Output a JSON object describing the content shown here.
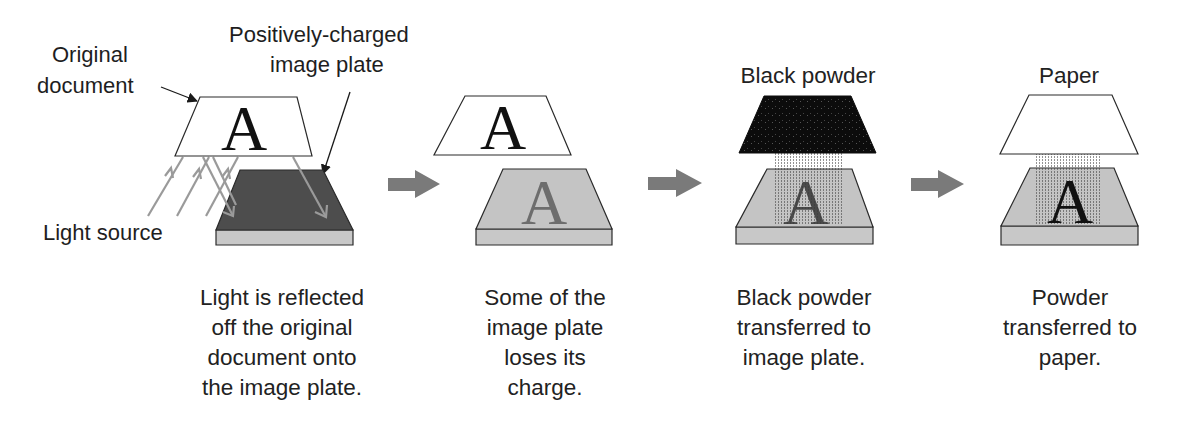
{
  "diagram": {
    "type": "process-flow",
    "colors": {
      "outline": "#2a2a2a",
      "plate_charged": "#4d4d4d",
      "plate_discharged": "#c4c4c4",
      "plate_side": "#c8c8c8",
      "flow_arrow": "#7a7a7a",
      "light_ray": "#9a9a9a",
      "black_powder": "#0c0c0c",
      "paper": "#ffffff"
    },
    "glyph_letter": "A",
    "panels": [
      {
        "id": "step-1",
        "labels": {
          "document": [
            "Original",
            "document"
          ],
          "plate": [
            "Positively-charged",
            "image plate"
          ],
          "light": "Light source"
        },
        "caption": [
          "Light is reflected",
          "off the original",
          "document onto",
          "the image plate."
        ]
      },
      {
        "id": "step-2",
        "caption": [
          "Some of the",
          "image plate",
          "loses its",
          "charge."
        ]
      },
      {
        "id": "step-3",
        "labels": {
          "top": "Black powder"
        },
        "caption": [
          "Black powder",
          "transferred to",
          "image plate."
        ]
      },
      {
        "id": "step-4",
        "labels": {
          "top": "Paper"
        },
        "caption": [
          "Powder",
          "transferred to",
          "paper."
        ]
      }
    ],
    "flow_arrows": 3
  }
}
